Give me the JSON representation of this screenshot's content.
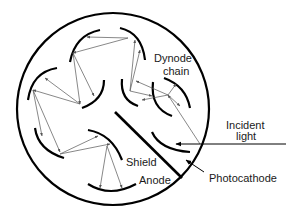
{
  "diagram": {
    "labels": {
      "dynode_chain_line1": "Dynode",
      "dynode_chain_line2": "chain",
      "incident_light_line1": "Incident",
      "incident_light_line2": "light",
      "shield": "Shield",
      "anode": "Anode",
      "photocathode": "Photocathode"
    },
    "components": [
      "envelope",
      "photocathode",
      "dynode chain",
      "shield",
      "anode",
      "incident light arrow",
      "electron trajectories"
    ],
    "colors": {
      "stroke": "#000000",
      "arrow": "#555555",
      "text": "#1a1a1a",
      "background": "#ffffff"
    }
  }
}
